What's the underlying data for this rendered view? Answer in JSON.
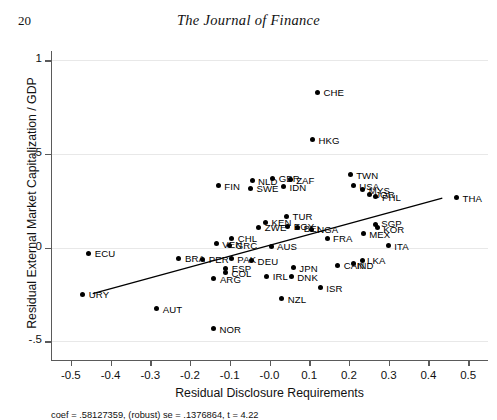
{
  "header": {
    "page_number": "20",
    "journal_title": "The Journal of Finance"
  },
  "chart_data": {
    "type": "scatter",
    "title": "",
    "xlabel": "Residual Disclosure Requirements",
    "ylabel": "Residual External Market Capitalization / GDP",
    "xlim": [
      -0.55,
      0.55
    ],
    "ylim": [
      -0.6,
      1.05
    ],
    "xticks": [
      "-0.5",
      "-0.4",
      "-0.3",
      "-0.2",
      "-0.1",
      "-0.0",
      "0.1",
      "0.2",
      "0.3",
      "0.4",
      "0.5"
    ],
    "xtick_values": [
      -0.5,
      -0.4,
      -0.3,
      -0.2,
      -0.1,
      0.0,
      0.1,
      0.2,
      0.3,
      0.4,
      0.5
    ],
    "yticks": [
      "1",
      ".5",
      "0",
      "-.5"
    ],
    "ytick_values": [
      1,
      0.5,
      0,
      -0.5
    ],
    "grid": "horizontal",
    "legend": "none",
    "marker": "filled-circle",
    "annotation": "coef = .58127359, (robust) se = .1376864, t = 4.22",
    "fit": {
      "coef": 0.58127359,
      "robust_se": 0.1376864,
      "t": 4.22,
      "x_start": -0.445,
      "y_start": -0.246,
      "x_end": 0.435,
      "y_end": 0.265
    },
    "points": [
      {
        "label": "CHE",
        "x": 0.121,
        "y": 0.83
      },
      {
        "label": "HKG",
        "x": 0.108,
        "y": 0.577
      },
      {
        "label": "TWN",
        "x": 0.203,
        "y": 0.388
      },
      {
        "label": "GBR",
        "x": 0.008,
        "y": 0.37
      },
      {
        "label": "ZAF",
        "x": 0.052,
        "y": 0.363
      },
      {
        "label": "NLD",
        "x": -0.044,
        "y": 0.357
      },
      {
        "label": "USA",
        "x": 0.211,
        "y": 0.33
      },
      {
        "label": "IDN",
        "x": 0.035,
        "y": 0.325
      },
      {
        "label": "FIN",
        "x": -0.129,
        "y": 0.33
      },
      {
        "label": "SWE",
        "x": -0.048,
        "y": 0.314
      },
      {
        "label": "MYS",
        "x": 0.235,
        "y": 0.31
      },
      {
        "label": "JOR",
        "x": 0.251,
        "y": 0.285
      },
      {
        "label": "PHL",
        "x": 0.268,
        "y": 0.272
      },
      {
        "label": "THA",
        "x": 0.471,
        "y": 0.266
      },
      {
        "label": "TUR",
        "x": 0.043,
        "y": 0.168
      },
      {
        "label": "KEN",
        "x": -0.01,
        "y": 0.136
      },
      {
        "label": "SGP",
        "x": 0.266,
        "y": 0.125
      },
      {
        "label": "KOR",
        "x": 0.271,
        "y": 0.11
      },
      {
        "label": "EGY",
        "x": 0.046,
        "y": 0.113
      },
      {
        "label": "ZWE",
        "x": -0.027,
        "y": 0.108
      },
      {
        "label": "BEL",
        "x": 0.071,
        "y": 0.106
      },
      {
        "label": "NGA",
        "x": 0.105,
        "y": 0.098
      },
      {
        "label": "ECU",
        "x": -0.455,
        "y": -0.03
      },
      {
        "label": "MEX",
        "x": 0.236,
        "y": 0.075
      },
      {
        "label": "CHL",
        "x": -0.095,
        "y": 0.05
      },
      {
        "label": "FRA",
        "x": 0.145,
        "y": 0.05
      },
      {
        "label": "VEN",
        "x": -0.134,
        "y": 0.02
      },
      {
        "label": "GRC",
        "x": -0.1,
        "y": 0.013
      },
      {
        "label": "AUS",
        "x": 0.004,
        "y": 0.008
      },
      {
        "label": "ITA",
        "x": 0.299,
        "y": 0.01
      },
      {
        "label": "BRA",
        "x": -0.228,
        "y": -0.056
      },
      {
        "label": "PER",
        "x": -0.168,
        "y": -0.062
      },
      {
        "label": "PAK",
        "x": -0.096,
        "y": -0.06
      },
      {
        "label": "DEU",
        "x": -0.045,
        "y": -0.069
      },
      {
        "label": "LKA",
        "x": 0.233,
        "y": -0.069
      },
      {
        "label": "IND",
        "x": 0.212,
        "y": -0.085
      },
      {
        "label": "CAN",
        "x": 0.172,
        "y": -0.093
      },
      {
        "label": "JPN",
        "x": 0.06,
        "y": -0.108
      },
      {
        "label": "ESP",
        "x": -0.11,
        "y": -0.11
      },
      {
        "label": "COL",
        "x": -0.111,
        "y": -0.131
      },
      {
        "label": "DNK",
        "x": 0.055,
        "y": -0.156
      },
      {
        "label": "IRL",
        "x": -0.007,
        "y": -0.152
      },
      {
        "label": "ARG",
        "x": -0.14,
        "y": -0.166
      },
      {
        "label": "URY",
        "x": -0.47,
        "y": -0.248
      },
      {
        "label": "ISR",
        "x": 0.128,
        "y": -0.215
      },
      {
        "label": "NZL",
        "x": 0.031,
        "y": -0.273
      },
      {
        "label": "AUT",
        "x": -0.284,
        "y": -0.326
      },
      {
        "label": "NOR",
        "x": -0.141,
        "y": -0.433
      }
    ]
  }
}
